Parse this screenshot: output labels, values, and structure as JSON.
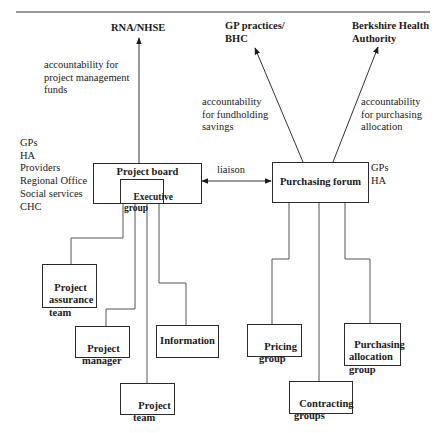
{
  "diagram": {
    "type": "organizational-accountability-diagram",
    "top_targets": [
      {
        "id": "rna_nhse",
        "label": "RNA/NHSE"
      },
      {
        "id": "gp_practices",
        "label": "GP practices/\nBHC"
      },
      {
        "id": "berkshire",
        "label": "Berkshire Health\nAuthority"
      }
    ],
    "edge_labels": {
      "project_funds": "accountability for\nproject management\nfunds",
      "fundholding": "accountability\nfor fundholding\nsavings",
      "purchasing_allocation": "accountability\nfor purchasing\nallocation",
      "liaison": "liaison"
    },
    "members": {
      "project_board": "GPs\nHA\nProviders\nRegional Office\nSocial services\nCHC",
      "purchasing_forum": "GPs\nHA"
    },
    "main_nodes": {
      "project_board": "Project board",
      "executive_group": "Executive\ngroup",
      "purchasing_forum": "Purchasing forum"
    },
    "project_children": [
      {
        "id": "assurance",
        "label": "Project\nassurance\nteam"
      },
      {
        "id": "manager",
        "label": "Project\nmanager"
      },
      {
        "id": "team",
        "label": "Project\nteam"
      },
      {
        "id": "information",
        "label": "Information"
      }
    ],
    "forum_children": [
      {
        "id": "pricing",
        "label": "Pricing\ngroup"
      },
      {
        "id": "contracting",
        "label": "Contracting\ngroups"
      },
      {
        "id": "allocation",
        "label": "Purchasing\nallocation\ngroup"
      }
    ],
    "edges": [
      {
        "from": "project_board",
        "to": "rna_nhse",
        "label": "accountability for project management funds",
        "arrow": "to"
      },
      {
        "from": "purchasing_forum",
        "to": "gp_practices",
        "label": "accountability for fundholding savings",
        "arrow": "to"
      },
      {
        "from": "purchasing_forum",
        "to": "berkshire",
        "label": "accountability for purchasing allocation",
        "arrow": "to"
      },
      {
        "from": "project_board",
        "to": "purchasing_forum",
        "label": "liaison",
        "arrow": "both"
      },
      {
        "from": "executive_group",
        "to": "assurance"
      },
      {
        "from": "executive_group",
        "to": "manager"
      },
      {
        "from": "executive_group",
        "to": "team"
      },
      {
        "from": "executive_group",
        "to": "information"
      },
      {
        "from": "purchasing_forum",
        "to": "pricing"
      },
      {
        "from": "purchasing_forum",
        "to": "contracting"
      },
      {
        "from": "purchasing_forum",
        "to": "allocation"
      }
    ]
  }
}
